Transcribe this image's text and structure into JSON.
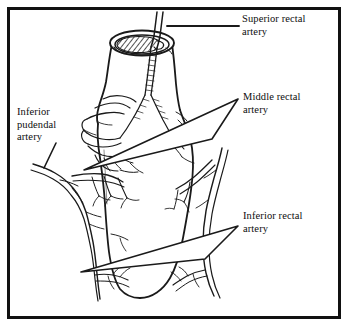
{
  "figure": {
    "kind": "anatomical-line-drawing",
    "frame_color": "#111111",
    "background_color": "#ffffff",
    "ink_color": "#1a1a1a"
  },
  "labels": {
    "superior_rectal": "Superior rectal\nartery",
    "middle_rectal": "Middle rectal\nartery",
    "inferior_rectal": "Inferior rectal\nartery",
    "inferior_pudendal": "Inferior\npudendal\nartery"
  },
  "leaders": [
    {
      "name": "superior-rectal-leader",
      "style": "plain-line"
    },
    {
      "name": "middle-rectal-leader",
      "style": "wedge-arrow"
    },
    {
      "name": "inferior-rectal-leader",
      "style": "wedge-arrow"
    },
    {
      "name": "inferior-pudendal-leader",
      "style": "plain-line"
    }
  ]
}
